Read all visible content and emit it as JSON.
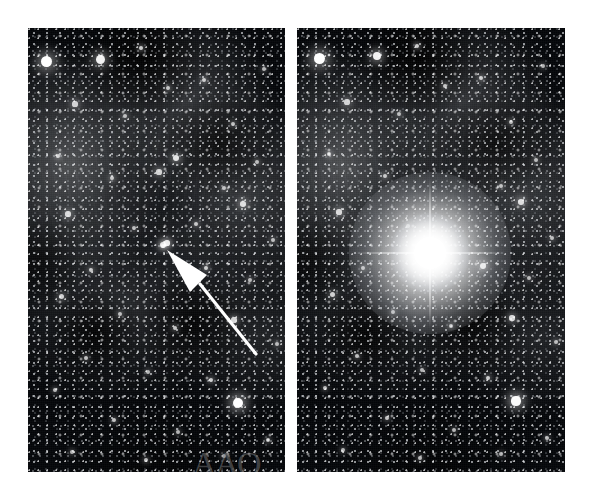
{
  "figure": {
    "type": "astronomical-image-pair",
    "background_color": "#ffffff",
    "width": 594,
    "height": 497
  },
  "panels": [
    {
      "id": "panel-left",
      "name": "before-panel",
      "label": "",
      "x": 28,
      "y": 28,
      "width": 257,
      "height": 444,
      "content": "Dense Milky Way star field with diffuse grey nebulosity and dark dust lanes. A white arrow points up-left to a faint progenitor star.",
      "has_arrow": true,
      "has_bright_star": false,
      "watermark": "AAO"
    },
    {
      "id": "panel-right",
      "name": "after-panel",
      "label": "",
      "x": 297,
      "y": 28,
      "width": 268,
      "height": 444,
      "content": "The same star field showing an extremely bright star with four-point diffraction spikes at the position previously marked by the arrow.",
      "has_arrow": false,
      "has_bright_star": true,
      "watermark": ""
    }
  ],
  "annotation": {
    "arrow": {
      "name": "pointer-arrow",
      "color": "#ffffff",
      "tip_x": 167,
      "tip_y": 250,
      "tail_x": 228,
      "tail_y": 326,
      "direction": "up-left",
      "target": "progenitor-star"
    }
  },
  "bright_star": {
    "name": "supernova-bright-star",
    "center_x": 430,
    "center_y": 253,
    "core_radius": 26,
    "spike_length": 150,
    "color": "#ffffff"
  },
  "colors": {
    "sky": "#05070a",
    "star": "#ffffff",
    "nebula": "#8a8c90",
    "page": "#ffffff"
  },
  "stars_left": [
    {
      "x": 18,
      "y": 33,
      "r": 5.5,
      "b": 1.0
    },
    {
      "x": 72,
      "y": 31,
      "r": 4.5,
      "b": 0.95
    },
    {
      "x": 113,
      "y": 20,
      "r": 2.4,
      "b": 0.8
    },
    {
      "x": 140,
      "y": 60,
      "r": 2.2,
      "b": 0.75
    },
    {
      "x": 47,
      "y": 76,
      "r": 2.6,
      "b": 0.8
    },
    {
      "x": 97,
      "y": 88,
      "r": 2.0,
      "b": 0.7
    },
    {
      "x": 176,
      "y": 52,
      "r": 2.3,
      "b": 0.78
    },
    {
      "x": 205,
      "y": 96,
      "r": 2.1,
      "b": 0.72
    },
    {
      "x": 236,
      "y": 41,
      "r": 2.0,
      "b": 0.7
    },
    {
      "x": 30,
      "y": 128,
      "r": 2.4,
      "b": 0.78
    },
    {
      "x": 84,
      "y": 150,
      "r": 2.2,
      "b": 0.74
    },
    {
      "x": 148,
      "y": 130,
      "r": 3.2,
      "b": 0.88
    },
    {
      "x": 131,
      "y": 144,
      "r": 2.6,
      "b": 0.8
    },
    {
      "x": 196,
      "y": 160,
      "r": 2.1,
      "b": 0.72
    },
    {
      "x": 229,
      "y": 134,
      "r": 2.0,
      "b": 0.7
    },
    {
      "x": 40,
      "y": 186,
      "r": 2.6,
      "b": 0.82
    },
    {
      "x": 106,
      "y": 200,
      "r": 2.0,
      "b": 0.7
    },
    {
      "x": 168,
      "y": 196,
      "r": 2.3,
      "b": 0.76
    },
    {
      "x": 215,
      "y": 176,
      "r": 2.8,
      "b": 0.84
    },
    {
      "x": 245,
      "y": 212,
      "r": 2.1,
      "b": 0.72
    },
    {
      "x": 135,
      "y": 217,
      "r": 3.0,
      "b": 0.86
    },
    {
      "x": 63,
      "y": 242,
      "r": 2.2,
      "b": 0.74
    },
    {
      "x": 178,
      "y": 240,
      "r": 2.4,
      "b": 0.78
    },
    {
      "x": 222,
      "y": 252,
      "r": 2.0,
      "b": 0.7
    },
    {
      "x": 33,
      "y": 268,
      "r": 2.5,
      "b": 0.8
    },
    {
      "x": 92,
      "y": 286,
      "r": 2.1,
      "b": 0.72
    },
    {
      "x": 147,
      "y": 300,
      "r": 2.3,
      "b": 0.76
    },
    {
      "x": 206,
      "y": 292,
      "r": 2.6,
      "b": 0.82
    },
    {
      "x": 249,
      "y": 316,
      "r": 2.0,
      "b": 0.7
    },
    {
      "x": 58,
      "y": 330,
      "r": 2.2,
      "b": 0.74
    },
    {
      "x": 120,
      "y": 344,
      "r": 2.0,
      "b": 0.7
    },
    {
      "x": 183,
      "y": 352,
      "r": 2.4,
      "b": 0.78
    },
    {
      "x": 27,
      "y": 362,
      "r": 2.1,
      "b": 0.72
    },
    {
      "x": 210,
      "y": 375,
      "r": 5.0,
      "b": 1.0
    },
    {
      "x": 86,
      "y": 392,
      "r": 2.3,
      "b": 0.76
    },
    {
      "x": 150,
      "y": 404,
      "r": 2.0,
      "b": 0.7
    },
    {
      "x": 240,
      "y": 412,
      "r": 2.2,
      "b": 0.74
    },
    {
      "x": 44,
      "y": 424,
      "r": 2.0,
      "b": 0.7
    },
    {
      "x": 118,
      "y": 432,
      "r": 2.1,
      "b": 0.72
    },
    {
      "x": 196,
      "y": 428,
      "r": 2.0,
      "b": 0.7
    },
    {
      "x": 135,
      "y": 218,
      "r": 2.0,
      "b": 0.68
    },
    {
      "x": 139,
      "y": 215,
      "r": 2.6,
      "b": 0.9
    }
  ],
  "stars_right": [
    {
      "x": 22,
      "y": 30,
      "r": 5.5,
      "b": 1.0
    },
    {
      "x": 80,
      "y": 28,
      "r": 4.2,
      "b": 0.95
    },
    {
      "x": 120,
      "y": 18,
      "r": 2.4,
      "b": 0.8
    },
    {
      "x": 148,
      "y": 58,
      "r": 2.2,
      "b": 0.75
    },
    {
      "x": 50,
      "y": 74,
      "r": 2.6,
      "b": 0.8
    },
    {
      "x": 102,
      "y": 86,
      "r": 2.0,
      "b": 0.7
    },
    {
      "x": 184,
      "y": 50,
      "r": 2.3,
      "b": 0.78
    },
    {
      "x": 214,
      "y": 94,
      "r": 2.1,
      "b": 0.72
    },
    {
      "x": 246,
      "y": 38,
      "r": 2.0,
      "b": 0.7
    },
    {
      "x": 32,
      "y": 126,
      "r": 2.4,
      "b": 0.78
    },
    {
      "x": 88,
      "y": 148,
      "r": 2.2,
      "b": 0.74
    },
    {
      "x": 204,
      "y": 158,
      "r": 2.1,
      "b": 0.72
    },
    {
      "x": 239,
      "y": 132,
      "r": 2.0,
      "b": 0.7
    },
    {
      "x": 42,
      "y": 184,
      "r": 2.6,
      "b": 0.82
    },
    {
      "x": 111,
      "y": 198,
      "r": 2.0,
      "b": 0.7
    },
    {
      "x": 224,
      "y": 174,
      "r": 2.8,
      "b": 0.84
    },
    {
      "x": 255,
      "y": 210,
      "r": 2.1,
      "b": 0.72
    },
    {
      "x": 66,
      "y": 240,
      "r": 2.2,
      "b": 0.74
    },
    {
      "x": 186,
      "y": 238,
      "r": 3.0,
      "b": 0.9
    },
    {
      "x": 232,
      "y": 250,
      "r": 2.0,
      "b": 0.7
    },
    {
      "x": 35,
      "y": 266,
      "r": 2.5,
      "b": 0.8
    },
    {
      "x": 96,
      "y": 284,
      "r": 2.1,
      "b": 0.72
    },
    {
      "x": 154,
      "y": 298,
      "r": 2.3,
      "b": 0.76
    },
    {
      "x": 215,
      "y": 290,
      "r": 2.6,
      "b": 0.82
    },
    {
      "x": 259,
      "y": 314,
      "r": 2.0,
      "b": 0.7
    },
    {
      "x": 60,
      "y": 328,
      "r": 2.2,
      "b": 0.74
    },
    {
      "x": 125,
      "y": 342,
      "r": 2.0,
      "b": 0.7
    },
    {
      "x": 191,
      "y": 350,
      "r": 2.4,
      "b": 0.78
    },
    {
      "x": 28,
      "y": 360,
      "r": 2.1,
      "b": 0.72
    },
    {
      "x": 219,
      "y": 373,
      "r": 4.6,
      "b": 0.98
    },
    {
      "x": 90,
      "y": 390,
      "r": 2.3,
      "b": 0.76
    },
    {
      "x": 157,
      "y": 402,
      "r": 2.0,
      "b": 0.7
    },
    {
      "x": 250,
      "y": 410,
      "r": 2.2,
      "b": 0.74
    },
    {
      "x": 46,
      "y": 422,
      "r": 2.0,
      "b": 0.7
    },
    {
      "x": 123,
      "y": 430,
      "r": 2.1,
      "b": 0.72
    },
    {
      "x": 204,
      "y": 426,
      "r": 2.0,
      "b": 0.7
    }
  ],
  "watermark": {
    "name": "aao-watermark",
    "text": "AAO"
  }
}
